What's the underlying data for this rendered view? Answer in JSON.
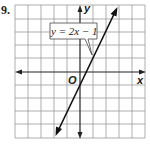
{
  "problem_number": "9.",
  "graph": {
    "equation_label": "y = 2x − 1",
    "origin_label": "O",
    "x_axis_label": "x",
    "y_axis_label": "y",
    "line": {
      "slope": 2,
      "intercept": -1
    },
    "grid_range": {
      "x": [
        -5,
        5
      ],
      "y": [
        -5,
        5
      ]
    },
    "colors": {
      "grid": "#9a9a9a",
      "axis": "#222222",
      "line": "#111111"
    }
  }
}
